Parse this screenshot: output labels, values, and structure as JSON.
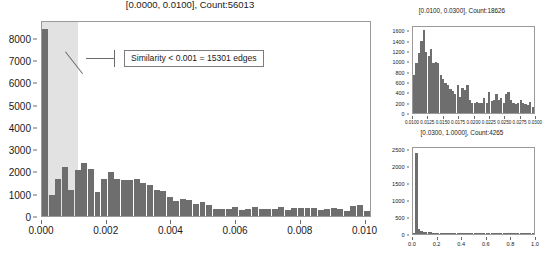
{
  "chart_data": [
    {
      "id": "main",
      "type": "bar",
      "title": "[0.0000, 0.0100], Count:56013",
      "xlabel": "",
      "ylabel": "",
      "xlim": [
        0.0,
        0.0102
      ],
      "ylim": [
        0,
        8800
      ],
      "grid": false,
      "legend": "none",
      "xticks": [
        "0.000",
        "0.002",
        "0.004",
        "0.006",
        "0.008",
        "0.010"
      ],
      "xtick_values": [
        0.0,
        0.002,
        0.004,
        0.006,
        0.008,
        0.01
      ],
      "yticks": [
        "0",
        "1000",
        "2000",
        "3000",
        "4000",
        "5000",
        "6000",
        "7000",
        "8000"
      ],
      "ytick_values": [
        0,
        1000,
        2000,
        3000,
        4000,
        5000,
        6000,
        7000,
        8000
      ],
      "bin_width": 0.0002,
      "x": [
        0.0001,
        0.0003,
        0.0005,
        0.0007,
        0.0009,
        0.0011,
        0.0013,
        0.0015,
        0.0017,
        0.0019,
        0.0021,
        0.0023,
        0.0025,
        0.0027,
        0.0029,
        0.0031,
        0.0033,
        0.0035,
        0.0037,
        0.0039,
        0.0041,
        0.0043,
        0.0045,
        0.0047,
        0.0049,
        0.0051,
        0.0053,
        0.0055,
        0.0057,
        0.0059,
        0.0061,
        0.0063,
        0.0065,
        0.0067,
        0.0069,
        0.0071,
        0.0073,
        0.0075,
        0.0077,
        0.0079,
        0.0081,
        0.0083,
        0.0085,
        0.0087,
        0.0089,
        0.0091,
        0.0093,
        0.0095,
        0.0097,
        0.0099
      ],
      "values": [
        8500,
        950,
        1700,
        2220,
        1200,
        2080,
        2400,
        2150,
        1080,
        1700,
        1980,
        1700,
        1620,
        1640,
        1700,
        1480,
        1400,
        1180,
        1150,
        840,
        700,
        760,
        720,
        540,
        620,
        510,
        300,
        330,
        320,
        430,
        290,
        300,
        420,
        300,
        340,
        340,
        420,
        290,
        380,
        380,
        370,
        380,
        280,
        300,
        350,
        330,
        250,
        450,
        480,
        250
      ],
      "annotations": [
        {
          "text": "Similarity < 0.001 = 15301 edges",
          "points_to_x": 0.0002,
          "points_to_y": 6400
        }
      ],
      "shaded_span": {
        "x0": 0.0,
        "x1": 0.0011,
        "color": "#e2e2e2"
      }
    },
    {
      "id": "top-right",
      "type": "bar",
      "title": "[0.0100, 0.0300], Count:18626",
      "xlabel": "",
      "ylabel": "",
      "xlim": [
        0.01,
        0.03
      ],
      "ylim": [
        0,
        1700
      ],
      "grid": false,
      "legend": "none",
      "xticks": [
        "0.0100",
        "0.0125",
        "0.0150",
        "0.0175",
        "0.0200",
        "0.0225",
        "0.0250",
        "0.0275",
        "0.0300"
      ],
      "xtick_values": [
        0.01,
        0.0125,
        0.015,
        0.0175,
        0.02,
        0.0225,
        0.025,
        0.0275,
        0.03
      ],
      "yticks": [
        "0",
        "200",
        "400",
        "600",
        "800",
        "1000",
        "1200",
        "1400",
        "1600"
      ],
      "ytick_values": [
        0,
        200,
        400,
        600,
        800,
        1000,
        1200,
        1400,
        1600
      ],
      "values": [
        760,
        980,
        1180,
        1420,
        1640,
        1200,
        1120,
        1270,
        980,
        1000,
        980,
        760,
        680,
        600,
        560,
        480,
        440,
        380,
        560,
        320,
        500,
        460,
        560,
        260,
        200,
        190,
        210,
        200,
        190,
        300,
        200,
        420,
        230,
        260,
        380,
        260,
        300,
        200,
        380,
        420,
        250,
        200,
        180,
        200,
        260,
        200,
        180,
        150,
        220,
        110
      ]
    },
    {
      "id": "bottom-right",
      "type": "bar",
      "title": "[0.0300, 1.0000], Count:4265",
      "xlabel": "",
      "ylabel": "",
      "xlim": [
        0.0,
        1.0
      ],
      "ylim": [
        0,
        2600
      ],
      "grid": false,
      "legend": "none",
      "xticks": [
        "0.0",
        "0.2",
        "0.4",
        "0.6",
        "0.8",
        "1.0"
      ],
      "xtick_values": [
        0.0,
        0.2,
        0.4,
        0.6,
        0.8,
        1.0
      ],
      "yticks": [
        "0",
        "500",
        "1000",
        "1500",
        "2000",
        "2500"
      ],
      "ytick_values": [
        0,
        500,
        1000,
        1500,
        2000,
        2500
      ],
      "values": [
        40,
        2450,
        150,
        90,
        70,
        60,
        55,
        48,
        42,
        38,
        35,
        32,
        30,
        28,
        26,
        24,
        22,
        21,
        20,
        19,
        18,
        17,
        16,
        15,
        14,
        13,
        12,
        12,
        11,
        11,
        10,
        10,
        9,
        9,
        8,
        8,
        8,
        7,
        7,
        6,
        6,
        6,
        5,
        5,
        5,
        4,
        4,
        4,
        3,
        3
      ]
    }
  ],
  "colors": {
    "bar": "#6e6e6e",
    "shade": "#e2e2e2",
    "axis": "#9a9a9a",
    "text": "#1a1a1a",
    "annotation_border": "#7d7d7d"
  }
}
